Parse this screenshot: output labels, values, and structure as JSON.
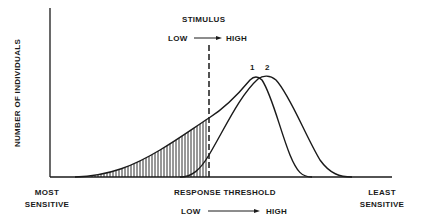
{
  "diagram": {
    "y_axis_label": "NUMBER OF INDIVIDUALS",
    "x_axis_label": "RESPONSE THRESHOLD",
    "x_axis_range": {
      "low": "LOW",
      "high": "HIGH"
    },
    "x_left_end": {
      "line1": "MOST",
      "line2": "SENSITIVE"
    },
    "x_right_end": {
      "line1": "LEAST",
      "line2": "SENSITIVE"
    },
    "stimulus": {
      "title": "STIMULUS",
      "low": "LOW",
      "high": "HIGH"
    },
    "curves": [
      {
        "id": "1",
        "label": "1",
        "description": "population distribution 1 (shifted toward lower thresholds)"
      },
      {
        "id": "2",
        "label": "2",
        "description": "population distribution 2 (higher thresholds)"
      }
    ],
    "annotations": {
      "dashed_line": "stimulus level threshold",
      "hatched_area": "individuals of curve 1 responding (threshold below stimulus)"
    },
    "colors": {
      "ink": "#1a1a1a",
      "background": "#ffffff"
    }
  }
}
